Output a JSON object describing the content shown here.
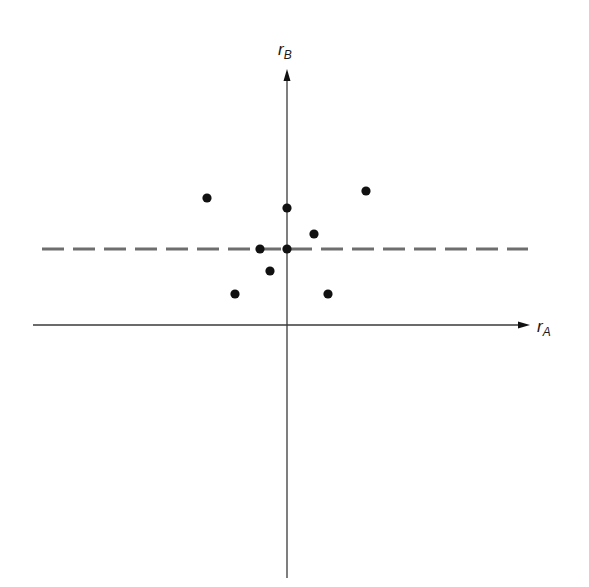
{
  "chart_data": {
    "type": "scatter",
    "title": "",
    "xlabel": "r_A",
    "ylabel": "r_B",
    "xlabel_main": "r",
    "xlabel_sub": "A",
    "ylabel_main": "r",
    "ylabel_sub": "B",
    "grid": false,
    "legend": null,
    "origin_px": [
      287,
      325
    ],
    "scale_px_per_unit": 10,
    "xlim": [
      -25.4,
      24.3
    ],
    "ylim": [
      -25.3,
      25.6
    ],
    "points": [
      {
        "x": -8.0,
        "y": 12.7
      },
      {
        "x": 0.0,
        "y": 11.7
      },
      {
        "x": 7.9,
        "y": 13.4
      },
      {
        "x": 2.7,
        "y": 9.1
      },
      {
        "x": -2.7,
        "y": 7.6
      },
      {
        "x": 0.0,
        "y": 7.6
      },
      {
        "x": -1.7,
        "y": 5.4
      },
      {
        "x": -5.2,
        "y": 3.1
      },
      {
        "x": 4.1,
        "y": 3.1
      }
    ],
    "reference_lines": [
      {
        "type": "horizontal",
        "y": 7.6,
        "style": "dashed",
        "color": "#6e6e6e",
        "x_from": -24.5,
        "x_to": 24.1
      }
    ]
  },
  "colors": {
    "axis": "#3a3a3a",
    "point": "#111111",
    "dashed_line": "#6e6e6e"
  }
}
